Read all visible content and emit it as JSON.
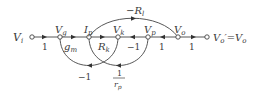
{
  "diagram": {
    "type": "signal-flow-graph",
    "nodes": [
      {
        "id": "Vi",
        "label": "V",
        "sub": "i"
      },
      {
        "id": "Vg",
        "label": "V",
        "sub": "g"
      },
      {
        "id": "Ip",
        "label": "I",
        "sub": "p"
      },
      {
        "id": "Vk",
        "label": "V",
        "sub": "k"
      },
      {
        "id": "Vp",
        "label": "V",
        "sub": "p"
      },
      {
        "id": "Vo",
        "label": "V",
        "sub": "o"
      },
      {
        "id": "Vout",
        "label": "V",
        "sub": "o",
        "prime_eq": "′=V",
        "sub2": "o"
      }
    ],
    "edges": [
      {
        "from": "Vi",
        "to": "Vg",
        "gain": "1"
      },
      {
        "from": "Vg",
        "to": "Ip",
        "gain": "g",
        "gain_sub": "m"
      },
      {
        "from": "Ip",
        "to": "Vk",
        "gain": "R",
        "gain_sub": "k"
      },
      {
        "from": "Vp",
        "to": "Vk",
        "gain": "−1"
      },
      {
        "from": "Vo",
        "to": "Vp",
        "gain": "1"
      },
      {
        "from": "Vo",
        "to": "Vout",
        "gain": "1"
      },
      {
        "from": "Ip",
        "to": "Vo",
        "gain": "−R",
        "gain_sub": "l"
      },
      {
        "from": "Vk",
        "to": "Vg",
        "gain": "−1"
      },
      {
        "from": "Vp",
        "to": "Ip",
        "gain_num": "1",
        "gain_den": "r",
        "gain_den_sub": "p"
      }
    ]
  }
}
